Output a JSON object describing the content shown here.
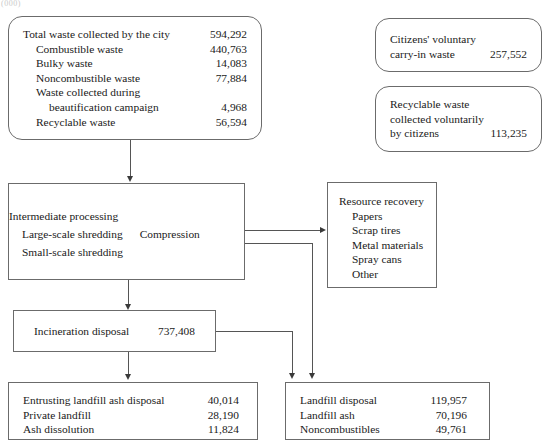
{
  "diagram": {
    "corner_note": "(000)",
    "boxes": {
      "total_waste": {
        "title": "Total waste collected by the city",
        "title_value": "594,292",
        "items": [
          {
            "label": "Combustible waste",
            "value": "440,763"
          },
          {
            "label": "Bulky waste",
            "value": "14,083"
          },
          {
            "label": "Noncombustible waste",
            "value": "77,884"
          }
        ],
        "campaign_line1": "Waste collected during",
        "campaign_line2": "beautification campaign",
        "campaign_value": "4,968",
        "recyclable_label": "Recyclable waste",
        "recyclable_value": "56,594"
      },
      "carry_in": {
        "line1": "Citizens' voluntary",
        "line2": "carry-in waste",
        "value": "257,552"
      },
      "recyclable_voluntary": {
        "line1": "Recyclable waste",
        "line2": "collected voluntarily",
        "line3": "by citizens",
        "value": "113,235"
      },
      "intermediate": {
        "title": "Intermediate processing",
        "items": [
          "Large-scale shredding",
          "Compression",
          "Small-scale shredding"
        ]
      },
      "resource_recovery": {
        "title": "Resource recovery",
        "items": [
          "Papers",
          "Scrap tires",
          "Metal materials",
          "Spray cans",
          "Other"
        ]
      },
      "incineration": {
        "label": "Incineration disposal",
        "value": "737,408"
      },
      "ash_disposal": {
        "items": [
          {
            "label": "Entrusting landfill ash disposal",
            "value": "40,014"
          },
          {
            "label": "Private landfill",
            "value": "28,190"
          },
          {
            "label": "Ash dissolution",
            "value": "11,824"
          }
        ]
      },
      "landfill_disposal": {
        "items": [
          {
            "label": "Landfill disposal",
            "value": "119,957"
          },
          {
            "label": "Landfill ash",
            "value": "70,196"
          },
          {
            "label": "Noncombustibles",
            "value": "49,761"
          }
        ]
      }
    },
    "colors": {
      "border": "#6b6b6b",
      "connector": "#555555",
      "text": "#1a1a1a",
      "background": "#ffffff"
    }
  }
}
